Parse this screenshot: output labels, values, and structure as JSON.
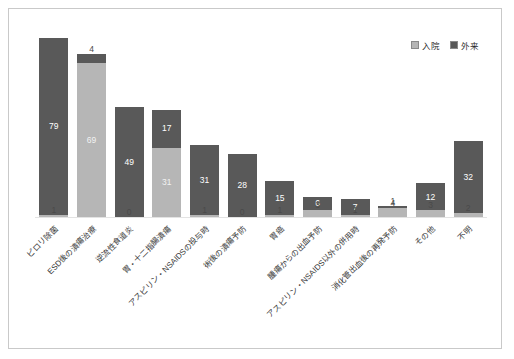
{
  "legend": {
    "position": "top-right",
    "entries": [
      {
        "label": "入院",
        "color": "#b6b6b6"
      },
      {
        "label": "外来",
        "color": "#595959"
      }
    ]
  },
  "colors": {
    "inpatient": "#b6b6b6",
    "outpatient": "#595959",
    "frame": "#c9c9c9",
    "baseline": "#e3e3e3",
    "background": "#ffffff"
  },
  "chart_data": {
    "type": "bar",
    "subtype": "stacked-vertical",
    "title": "",
    "subtitle": "",
    "xlabel": "",
    "ylabel": "",
    "grid": false,
    "legend_position": "top-right",
    "ylim": [
      0,
      85
    ],
    "categories": [
      "ピロリ除菌",
      "ESD後の潰瘍治療",
      "逆流性食道炎",
      "胃・十二指腸潰瘍",
      "アスピリン・NSAIDSの投与時",
      "術後の潰瘍予防",
      "胃癌",
      "腫瘍からの出血予防",
      "アスピリン・NSAIDS以外の併用時",
      "消化管出血後の再発予防",
      "その他",
      "不明"
    ],
    "series": [
      {
        "name": "入院",
        "color": "#b6b6b6",
        "values": [
          1,
          69,
          0,
          31,
          1,
          0,
          1,
          3,
          1,
          4,
          3,
          2
        ]
      },
      {
        "name": "外来",
        "color": "#595959",
        "values": [
          79,
          4,
          49,
          17,
          31,
          28,
          15,
          6,
          7,
          1,
          12,
          32
        ]
      }
    ],
    "totals": [
      80,
      73,
      49,
      48,
      32,
      28,
      16,
      9,
      8,
      5,
      15,
      34
    ]
  }
}
